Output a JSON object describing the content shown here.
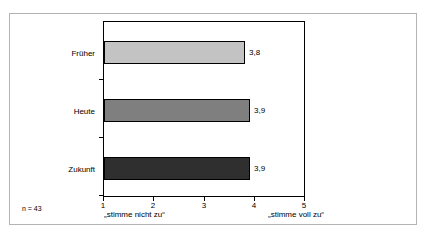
{
  "chart_data": {
    "type": "bar",
    "orientation": "horizontal",
    "title": "",
    "subtitle": "",
    "xlabel": "",
    "ylabel": "",
    "categories": [
      "Früher",
      "Heute",
      "Zukunft"
    ],
    "values": [
      3.8,
      3.9,
      3.9
    ],
    "value_labels": [
      "3,8",
      "3,9",
      "3,9"
    ],
    "series": [
      {
        "name": "Mittelwert",
        "values": [
          3.8,
          3.9,
          3.9
        ]
      }
    ],
    "bar_colors": [
      "#c3c3c3",
      "#7f7f7f",
      "#2f2f2f"
    ],
    "bar_edge_color": "#000000",
    "xlim": [
      1,
      5
    ],
    "xticks": [
      1,
      2,
      3,
      4,
      5
    ],
    "xtick_labels": [
      "1",
      "2",
      "3",
      "4",
      "5"
    ],
    "grid": false,
    "legend": false,
    "legend_position": "none",
    "annotations": [
      {
        "name": "sample-size",
        "text": "n = 43"
      },
      {
        "name": "scale-anchor-low",
        "text": "„stimme nicht zu“"
      },
      {
        "name": "scale-anchor-high",
        "text": "„stimme voll zu“"
      }
    ]
  },
  "axis": {
    "ticks": [
      {
        "label": "1",
        "value": 1
      },
      {
        "label": "2",
        "value": 2
      },
      {
        "label": "3",
        "value": 3
      },
      {
        "label": "4",
        "value": 4
      },
      {
        "label": "5",
        "value": 5
      }
    ]
  },
  "bars": [
    {
      "category": "Früher",
      "value": 3.8,
      "value_label": "3,8",
      "color": "#c3c3c3"
    },
    {
      "category": "Heute",
      "value": 3.9,
      "value_label": "3,9",
      "color": "#7f7f7f"
    },
    {
      "category": "Zukunft",
      "value": 3.9,
      "value_label": "3,9",
      "color": "#2f2f2f"
    }
  ],
  "footnote": {
    "sample_size": "n = 43"
  },
  "scale": {
    "low_anchor": "„stimme nicht zu“",
    "high_anchor": "„stimme voll zu“"
  }
}
